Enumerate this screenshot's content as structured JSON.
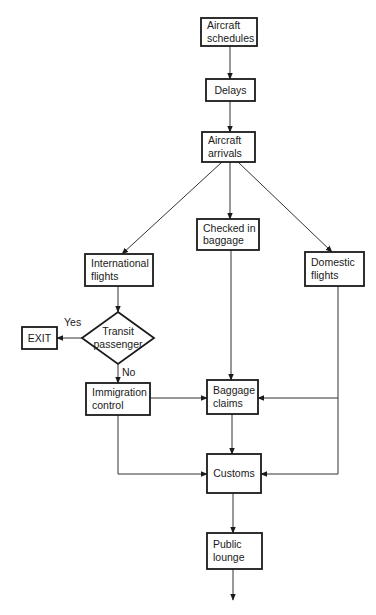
{
  "diagram": {
    "type": "flowchart",
    "nodes": [
      {
        "id": "aircraft_schedules",
        "shape": "rect",
        "x": 201,
        "y": 18,
        "w": 56,
        "h": 28,
        "lines": [
          "Aircraft",
          "schedules"
        ]
      },
      {
        "id": "delays",
        "shape": "rect",
        "x": 206,
        "y": 79,
        "w": 49,
        "h": 22,
        "lines": [
          "Delays"
        ]
      },
      {
        "id": "aircraft_arrivals",
        "shape": "rect",
        "x": 202,
        "y": 132,
        "w": 53,
        "h": 30,
        "lines": [
          "Aircraft",
          "arrivals"
        ]
      },
      {
        "id": "checked_in_baggage",
        "shape": "rect",
        "x": 197,
        "y": 219,
        "w": 62,
        "h": 31,
        "lines": [
          "Checked in",
          "baggage"
        ]
      },
      {
        "id": "international_flights",
        "shape": "rect",
        "x": 85,
        "y": 254,
        "w": 68,
        "h": 32,
        "lines": [
          "International",
          "flights"
        ]
      },
      {
        "id": "domestic_flights",
        "shape": "rect",
        "x": 305,
        "y": 252,
        "w": 59,
        "h": 34,
        "lines": [
          "Domestic",
          "flights"
        ]
      },
      {
        "id": "transit_passenger",
        "shape": "diamond",
        "cx": 118,
        "cy": 338,
        "rx": 36,
        "ry": 26,
        "lines": [
          "Transit",
          "passenger"
        ]
      },
      {
        "id": "exit",
        "shape": "rect",
        "x": 22,
        "y": 327,
        "w": 35,
        "h": 22,
        "lines": [
          "EXIT"
        ]
      },
      {
        "id": "immigration_control",
        "shape": "rect",
        "x": 86,
        "y": 383,
        "w": 64,
        "h": 32,
        "lines": [
          "Immigration",
          "control"
        ]
      },
      {
        "id": "baggage_claims",
        "shape": "rect",
        "x": 207,
        "y": 380,
        "w": 51,
        "h": 34,
        "lines": [
          "Baggage",
          "claims"
        ]
      },
      {
        "id": "customs",
        "shape": "rect",
        "x": 207,
        "y": 454,
        "w": 54,
        "h": 39,
        "lines": [
          "Customs"
        ]
      },
      {
        "id": "public_lounge",
        "shape": "rect",
        "x": 207,
        "y": 533,
        "w": 55,
        "h": 36,
        "lines": [
          "Public",
          "lounge"
        ]
      }
    ],
    "edges": [
      {
        "from": "aircraft_schedules",
        "to": "delays",
        "points": [
          [
            230,
            46
          ],
          [
            230,
            79
          ]
        ]
      },
      {
        "from": "delays",
        "to": "aircraft_arrivals",
        "points": [
          [
            230,
            101
          ],
          [
            230,
            132
          ]
        ]
      },
      {
        "from": "aircraft_arrivals",
        "to": "international_flights",
        "points": [
          [
            222,
            162
          ],
          [
            122,
            254
          ]
        ]
      },
      {
        "from": "aircraft_arrivals",
        "to": "checked_in_baggage",
        "points": [
          [
            230,
            162
          ],
          [
            230,
            219
          ]
        ]
      },
      {
        "from": "aircraft_arrivals",
        "to": "domestic_flights",
        "points": [
          [
            238,
            162
          ],
          [
            332,
            252
          ]
        ]
      },
      {
        "from": "international_flights",
        "to": "transit_passenger",
        "points": [
          [
            118,
            286
          ],
          [
            118,
            312
          ]
        ]
      },
      {
        "from": "transit_passenger",
        "to": "exit",
        "label": "Yes",
        "label_pos": [
          64,
          326
        ],
        "points": [
          [
            82,
            338
          ],
          [
            57,
            338
          ]
        ]
      },
      {
        "from": "transit_passenger",
        "to": "immigration_control",
        "label": "No",
        "label_pos": [
          122,
          376
        ],
        "points": [
          [
            118,
            364
          ],
          [
            118,
            383
          ]
        ]
      },
      {
        "from": "immigration_control",
        "to": "baggage_claims",
        "points": [
          [
            150,
            398
          ],
          [
            207,
            398
          ]
        ]
      },
      {
        "from": "checked_in_baggage",
        "to": "baggage_claims",
        "points": [
          [
            231,
            250
          ],
          [
            231,
            380
          ]
        ]
      },
      {
        "from": "domestic_flights",
        "to": "baggage_claims",
        "points": [
          [
            338,
            286
          ],
          [
            338,
            398
          ],
          [
            258,
            398
          ]
        ]
      },
      {
        "from": "domestic_flights",
        "to": "customs",
        "points": [
          [
            338,
            398
          ],
          [
            338,
            474
          ],
          [
            261,
            474
          ]
        ]
      },
      {
        "from": "immigration_control",
        "to": "customs",
        "points": [
          [
            118,
            415
          ],
          [
            118,
            474
          ],
          [
            207,
            474
          ]
        ]
      },
      {
        "from": "baggage_claims",
        "to": "customs",
        "points": [
          [
            232,
            414
          ],
          [
            232,
            454
          ]
        ]
      },
      {
        "from": "customs",
        "to": "public_lounge",
        "points": [
          [
            233,
            493
          ],
          [
            233,
            533
          ]
        ]
      },
      {
        "from": "public_lounge",
        "to": "out",
        "points": [
          [
            233,
            569
          ],
          [
            233,
            600
          ]
        ]
      }
    ]
  }
}
